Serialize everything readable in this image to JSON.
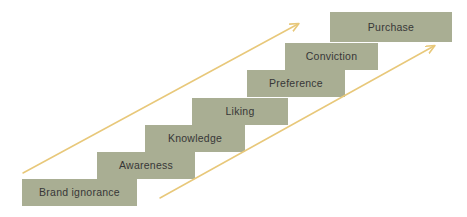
{
  "diagram": {
    "type": "staircase",
    "canvas": {
      "width": 467,
      "height": 217
    },
    "colors": {
      "background": "#ffffff",
      "step_fill": "#a9ae93",
      "step_text": "#373737",
      "arrow": "#e8c87a"
    },
    "steps": [
      {
        "label": "Brand ignorance",
        "order": 1,
        "x": 22,
        "y": 179,
        "w": 115,
        "h": 27
      },
      {
        "label": "Awareness",
        "order": 2,
        "x": 97,
        "y": 152,
        "w": 98,
        "h": 27
      },
      {
        "label": "Knowledge",
        "order": 3,
        "x": 145,
        "y": 125,
        "w": 100,
        "h": 27
      },
      {
        "label": "Liking",
        "order": 4,
        "x": 192,
        "y": 98,
        "w": 96,
        "h": 27
      },
      {
        "label": "Preference",
        "order": 5,
        "x": 247,
        "y": 70,
        "w": 98,
        "h": 27
      },
      {
        "label": "Conviction",
        "order": 6,
        "x": 285,
        "y": 43,
        "w": 93,
        "h": 27
      },
      {
        "label": "Purchase",
        "order": 7,
        "x": 330,
        "y": 12,
        "w": 122,
        "h": 30
      }
    ],
    "arrows": [
      {
        "name": "upper-progression-arrow",
        "layer": "behind",
        "x1": 23,
        "y1": 173,
        "x2": 298,
        "y2": 24
      },
      {
        "name": "lower-progression-arrow",
        "layer": "front",
        "x1": 160,
        "y1": 198,
        "x2": 434,
        "y2": 46
      }
    ]
  }
}
